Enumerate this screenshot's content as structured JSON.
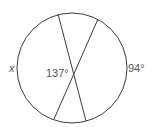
{
  "diagram": {
    "type": "circle-intersecting-chords",
    "circle": {
      "cx": 72,
      "cy": 68,
      "r": 55
    },
    "chords": [
      {
        "x1": 58,
        "y1": 14,
        "x2": 86,
        "y2": 121
      },
      {
        "x1": 98,
        "y1": 19,
        "x2": 54,
        "y2": 119
      }
    ],
    "labels": {
      "left_arc": "x",
      "vertex_angle": "137°",
      "right_arc": "94°"
    },
    "colors": {
      "stroke": "#3a3a3a",
      "text": "#555555",
      "background": "#ffffff"
    }
  }
}
